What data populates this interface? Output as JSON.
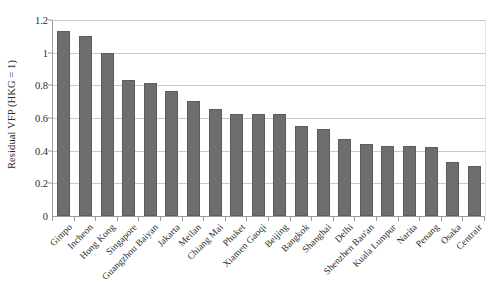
{
  "chart_data": {
    "type": "bar",
    "title": "",
    "xlabel": "",
    "ylabel": "Residual VFP (HKG = 1)",
    "ylim": [
      0,
      1.2
    ],
    "yticks": [
      "0",
      "0.2",
      "0.4",
      "0.6",
      "0.8",
      "1",
      "1.2"
    ],
    "ytick_values": [
      0,
      0.2,
      0.4,
      0.6,
      0.8,
      1,
      1.2
    ],
    "grid": true,
    "legend": null,
    "bar_color": "#6e6e6e",
    "bar_edge_color": "#5c5c5c",
    "gridline_color": "#c9c9c9",
    "axis_color": "#9a9a9a",
    "categories": [
      "Gimpo",
      "Incheon",
      "Hong Kong",
      "Singapore",
      "Guangzhou Baiyan",
      "Jakarta",
      "Meilan",
      "Chiang Mai",
      "Phuket",
      "Xiamen Gaoqi",
      "Beijing",
      "Bangkok",
      "Shanghai",
      "Delhi",
      "Shenzhen Bao'an",
      "Kuala Lumpur",
      "Narita",
      "Penang",
      "Osaka",
      "Centrair"
    ],
    "values": [
      1.13,
      1.1,
      1.0,
      0.83,
      0.815,
      0.765,
      0.705,
      0.655,
      0.625,
      0.625,
      0.625,
      0.55,
      0.53,
      0.47,
      0.44,
      0.43,
      0.43,
      0.425,
      0.33,
      0.305
    ]
  }
}
